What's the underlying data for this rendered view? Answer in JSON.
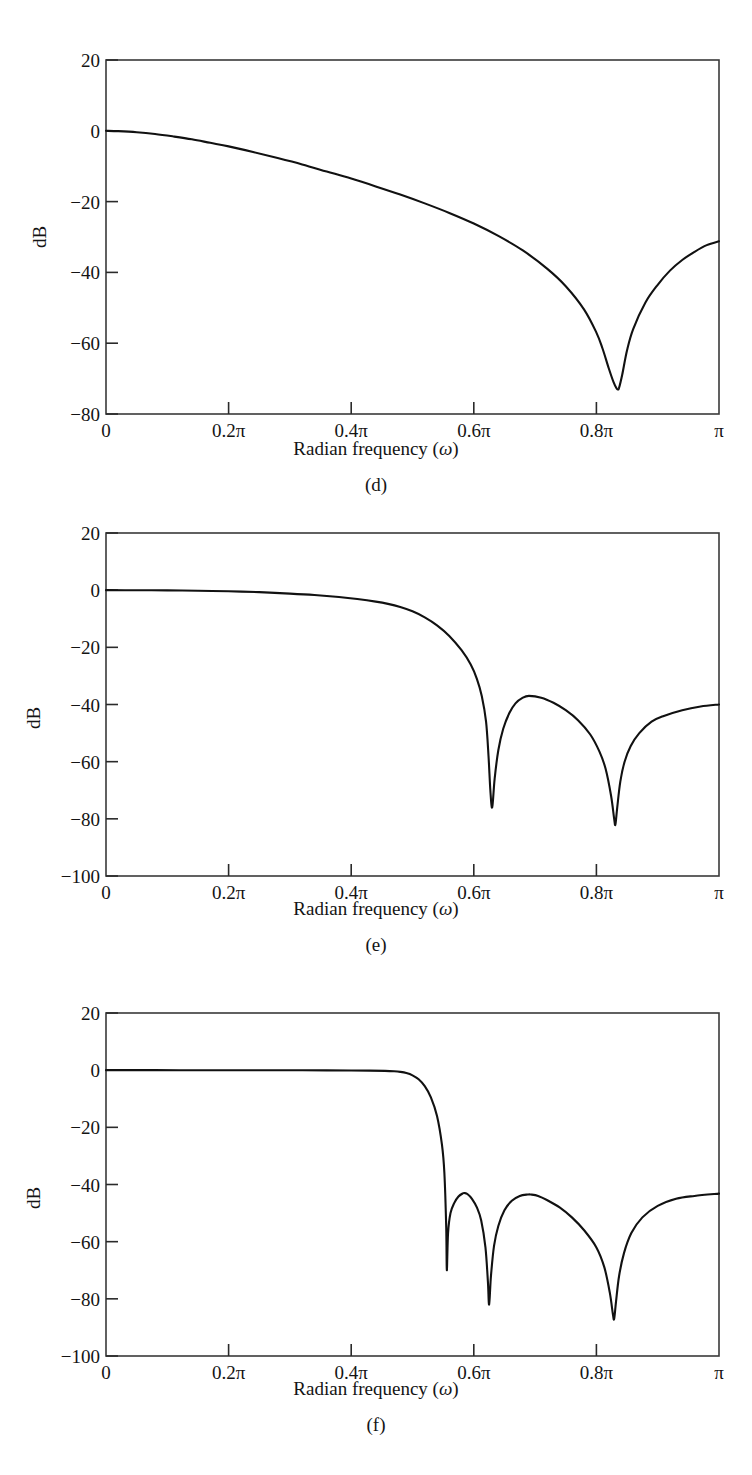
{
  "figure": {
    "axis_title_prefix": "Radian frequency (",
    "axis_title_symbol": "ω",
    "axis_title_suffix": ")",
    "y_axis_label": "dB",
    "line_color": "#111111",
    "frame_color": "#3a3a3a",
    "background": "#ffffff"
  },
  "panels": [
    {
      "caption": "(d)",
      "y_label": "dB",
      "y_ticks": [
        "20",
        "0",
        "−20",
        "−40",
        "−60",
        "−80"
      ],
      "x_ticks": [
        "0",
        "0.2π",
        "0.4π",
        "0.6π",
        "0.8π",
        "π"
      ]
    },
    {
      "caption": "(e)",
      "y_label": "dB",
      "y_ticks": [
        "20",
        "0",
        "−20",
        "−40",
        "−60",
        "−80",
        "−100"
      ],
      "x_ticks": [
        "0",
        "0.2π",
        "0.4π",
        "0.6π",
        "0.8π",
        "π"
      ]
    },
    {
      "caption": "(f)",
      "y_label": "dB",
      "y_ticks": [
        "20",
        "0",
        "−20",
        "−40",
        "−60",
        "−80",
        "−100"
      ],
      "x_ticks": [
        "0",
        "0.2π",
        "0.4π",
        "0.6π",
        "0.8π",
        "π"
      ]
    }
  ],
  "chart_data": [
    {
      "type": "line",
      "panel": "(d)",
      "title": "",
      "xlabel": "Radian frequency (ω)",
      "ylabel": "dB",
      "xlim": [
        0,
        1
      ],
      "ylim": [
        -80,
        20
      ],
      "x_unit": "pi radians",
      "xticks": [
        0,
        0.2,
        0.4,
        0.6,
        0.8,
        1.0
      ],
      "xticklabels": [
        "0",
        "0.2π",
        "0.4π",
        "0.6π",
        "0.8π",
        "π"
      ],
      "yticks": [
        20,
        0,
        -20,
        -40,
        -60,
        -80
      ],
      "grid": false,
      "legend": "none",
      "nulls": [
        {
          "x": 0.835,
          "y": -73
        }
      ],
      "series": [
        {
          "name": "magnitude response (d)",
          "x": [
            0.0,
            0.02,
            0.05,
            0.08,
            0.11,
            0.14,
            0.17,
            0.2,
            0.24,
            0.28,
            0.32,
            0.36,
            0.4,
            0.44,
            0.48,
            0.52,
            0.56,
            0.6,
            0.64,
            0.68,
            0.72,
            0.75,
            0.78,
            0.8,
            0.81,
            0.82,
            0.828,
            0.833,
            0.835,
            0.837,
            0.842,
            0.85,
            0.86,
            0.88,
            0.9,
            0.92,
            0.94,
            0.96,
            0.98,
            1.0
          ],
          "y": [
            0.0,
            -0.1,
            -0.4,
            -0.9,
            -1.6,
            -2.4,
            -3.4,
            -4.4,
            -6.0,
            -7.7,
            -9.5,
            -11.5,
            -13.5,
            -15.7,
            -18.0,
            -20.5,
            -23.2,
            -26.2,
            -29.7,
            -33.8,
            -39.0,
            -43.9,
            -50.5,
            -57.0,
            -61.5,
            -67.0,
            -71.0,
            -72.8,
            -73.0,
            -72.6,
            -69.0,
            -62.0,
            -56.0,
            -48.5,
            -43.5,
            -39.5,
            -36.5,
            -34.2,
            -32.3,
            -31.2
          ]
        }
      ]
    },
    {
      "type": "line",
      "panel": "(e)",
      "title": "",
      "xlabel": "Radian frequency (ω)",
      "ylabel": "dB",
      "xlim": [
        0,
        1
      ],
      "ylim": [
        -100,
        20
      ],
      "x_unit": "pi radians",
      "xticks": [
        0,
        0.2,
        0.4,
        0.6,
        0.8,
        1.0
      ],
      "xticklabels": [
        "0",
        "0.2π",
        "0.4π",
        "0.6π",
        "0.8π",
        "π"
      ],
      "yticks": [
        20,
        0,
        -20,
        -40,
        -60,
        -80,
        -100
      ],
      "grid": false,
      "legend": "none",
      "nulls": [
        {
          "x": 0.627,
          "y": -76
        },
        {
          "x": 0.831,
          "y": -82
        }
      ],
      "sidelobe_peaks": [
        {
          "x": 0.69,
          "y": -37
        }
      ],
      "series": [
        {
          "name": "magnitude response (e)",
          "x": [
            0.0,
            0.05,
            0.1,
            0.15,
            0.2,
            0.25,
            0.3,
            0.34,
            0.38,
            0.41,
            0.44,
            0.46,
            0.48,
            0.5,
            0.52,
            0.54,
            0.56,
            0.58,
            0.595,
            0.605,
            0.613,
            0.62,
            0.624,
            0.627,
            0.63,
            0.634,
            0.64,
            0.648,
            0.658,
            0.668,
            0.68,
            0.69,
            0.71,
            0.73,
            0.75,
            0.77,
            0.79,
            0.805,
            0.815,
            0.824,
            0.829,
            0.831,
            0.834,
            0.839,
            0.846,
            0.856,
            0.87,
            0.89,
            0.91,
            0.94,
            0.97,
            1.0
          ],
          "y": [
            0.0,
            -0.02,
            -0.08,
            -0.2,
            -0.4,
            -0.7,
            -1.2,
            -1.7,
            -2.4,
            -3.1,
            -4.0,
            -4.8,
            -5.9,
            -7.4,
            -9.5,
            -12.3,
            -16.0,
            -21.0,
            -26.0,
            -31.0,
            -37.0,
            -46.0,
            -58.0,
            -70.0,
            -76.0,
            -66.0,
            -56.0,
            -48.5,
            -43.0,
            -39.6,
            -37.6,
            -37.0,
            -37.6,
            -39.4,
            -42.0,
            -45.5,
            -50.5,
            -56.5,
            -62.5,
            -72.0,
            -80.0,
            -82.0,
            -76.0,
            -67.0,
            -60.0,
            -54.5,
            -50.0,
            -46.0,
            -44.0,
            -42.0,
            -40.7,
            -40.0
          ]
        }
      ]
    },
    {
      "type": "line",
      "panel": "(f)",
      "title": "",
      "xlabel": "Radian frequency (ω)",
      "ylabel": "dB",
      "xlim": [
        0,
        1
      ],
      "ylim": [
        -100,
        20
      ],
      "x_unit": "pi radians",
      "xticks": [
        0,
        0.2,
        0.4,
        0.6,
        0.8,
        1.0
      ],
      "xticklabels": [
        "0",
        "0.2π",
        "0.4π",
        "0.6π",
        "0.8π",
        "π"
      ],
      "yticks": [
        20,
        0,
        -20,
        -40,
        -60,
        -80,
        -100
      ],
      "grid": false,
      "legend": "none",
      "nulls": [
        {
          "x": 0.556,
          "y": -70
        },
        {
          "x": 0.625,
          "y": -82
        },
        {
          "x": 0.829,
          "y": -87
        }
      ],
      "sidelobe_peaks": [
        {
          "x": 0.585,
          "y": -43
        },
        {
          "x": 0.693,
          "y": -43.5
        }
      ],
      "series": [
        {
          "name": "magnitude response (f)",
          "x": [
            0.0,
            0.08,
            0.16,
            0.24,
            0.3,
            0.36,
            0.4,
            0.43,
            0.455,
            0.47,
            0.48,
            0.49,
            0.5,
            0.51,
            0.52,
            0.53,
            0.54,
            0.548,
            0.552,
            0.555,
            0.556,
            0.558,
            0.562,
            0.568,
            0.575,
            0.582,
            0.585,
            0.59,
            0.597,
            0.605,
            0.612,
            0.619,
            0.623,
            0.625,
            0.628,
            0.633,
            0.64,
            0.65,
            0.662,
            0.675,
            0.688,
            0.693,
            0.705,
            0.72,
            0.74,
            0.76,
            0.78,
            0.8,
            0.813,
            0.822,
            0.827,
            0.829,
            0.832,
            0.837,
            0.845,
            0.857,
            0.875,
            0.9,
            0.93,
            0.96,
            1.0
          ],
          "y": [
            0.0,
            0.0,
            -0.01,
            -0.02,
            -0.04,
            -0.07,
            -0.1,
            -0.15,
            -0.25,
            -0.4,
            -0.6,
            -1.0,
            -1.8,
            -3.2,
            -5.6,
            -9.5,
            -16.0,
            -26.0,
            -36.0,
            -55.0,
            -70.0,
            -57.0,
            -50.0,
            -46.5,
            -44.2,
            -43.1,
            -43.0,
            -43.4,
            -45.0,
            -48.0,
            -52.5,
            -62.0,
            -74.0,
            -82.0,
            -72.0,
            -61.5,
            -54.5,
            -49.0,
            -45.7,
            -44.0,
            -43.5,
            -43.5,
            -44.0,
            -45.5,
            -48.0,
            -51.5,
            -56.0,
            -62.0,
            -69.0,
            -78.0,
            -85.5,
            -87.0,
            -81.0,
            -72.0,
            -64.0,
            -57.0,
            -51.5,
            -47.5,
            -45.0,
            -44.0,
            -43.2
          ]
        }
      ]
    }
  ]
}
